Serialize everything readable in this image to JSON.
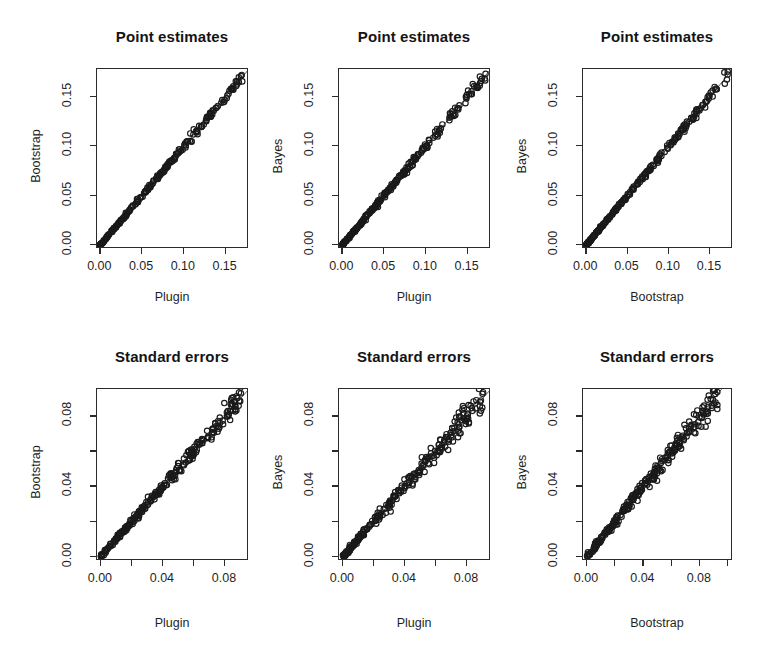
{
  "figure": {
    "width": 774,
    "height": 668,
    "background": "#ffffff",
    "foreground": "#1a1a1a",
    "point_style": "open-circle",
    "layout": "2 rows x 3 columns of scatterplots"
  },
  "chart_data": [
    {
      "id": "panel-1",
      "type": "scatter",
      "title": "Point estimates",
      "xlabel": "Plugin",
      "ylabel": "Bootstrap",
      "xlim": [
        -0.004,
        0.178
      ],
      "ylim": [
        -0.004,
        0.178
      ],
      "xticks": [
        0.0,
        0.05,
        0.1,
        0.15
      ],
      "yticks": [
        0.0,
        0.05,
        0.1,
        0.15
      ],
      "xticklabels": [
        "0.00",
        "0.05",
        "0.10",
        "0.15"
      ],
      "yticklabels": [
        "0.00",
        "0.05",
        "0.10",
        "0.15"
      ],
      "grid": false,
      "legend": "none",
      "reference_line": "y = x",
      "seed": 11,
      "n": 260,
      "noise": 0.0022,
      "xmax_data": 0.172,
      "density_exponent": 1.55
    },
    {
      "id": "panel-2",
      "type": "scatter",
      "title": "Point estimates",
      "xlabel": "Plugin",
      "ylabel": "Bayes",
      "xlim": [
        -0.004,
        0.178
      ],
      "ylim": [
        -0.004,
        0.178
      ],
      "xticks": [
        0.0,
        0.05,
        0.1,
        0.15
      ],
      "yticks": [
        0.0,
        0.05,
        0.1,
        0.15
      ],
      "xticklabels": [
        "0.00",
        "0.05",
        "0.10",
        "0.15"
      ],
      "yticklabels": [
        "0.00",
        "0.05",
        "0.10",
        "0.15"
      ],
      "grid": false,
      "legend": "none",
      "reference_line": "y = x",
      "seed": 27,
      "n": 260,
      "noise": 0.0026,
      "xmax_data": 0.172,
      "density_exponent": 1.55
    },
    {
      "id": "panel-3",
      "type": "scatter",
      "title": "Point estimates",
      "xlabel": "Bootstrap",
      "ylabel": "Bayes",
      "xlim": [
        -0.004,
        0.178
      ],
      "ylim": [
        -0.004,
        0.178
      ],
      "xticks": [
        0.0,
        0.05,
        0.1,
        0.15
      ],
      "yticks": [
        0.0,
        0.05,
        0.1,
        0.15
      ],
      "xticklabels": [
        "0.00",
        "0.05",
        "0.10",
        "0.15"
      ],
      "yticklabels": [
        "0.00",
        "0.05",
        "0.10",
        "0.15"
      ],
      "grid": false,
      "legend": "none",
      "reference_line": "y = x",
      "seed": 43,
      "n": 260,
      "noise": 0.0024,
      "xmax_data": 0.172,
      "density_exponent": 1.55
    },
    {
      "id": "panel-4",
      "type": "scatter",
      "title": "Standard errors",
      "xlabel": "Plugin",
      "ylabel": "Bootstrap",
      "xlim": [
        -0.0025,
        0.0955
      ],
      "ylim": [
        -0.0025,
        0.0955
      ],
      "xticks": [
        0.0,
        0.02,
        0.04,
        0.06,
        0.08
      ],
      "yticks": [
        0.0,
        0.02,
        0.04,
        0.06,
        0.08
      ],
      "xticklabels": [
        "0.00",
        "",
        "0.04",
        "",
        "0.08"
      ],
      "yticklabels": [
        "0.00",
        "",
        "0.04",
        "",
        "0.08"
      ],
      "grid": false,
      "legend": "none",
      "reference_line": "y = x",
      "seed": 61,
      "n": 260,
      "noise": 0.0028,
      "xmax_data": 0.0905,
      "density_exponent": 1.2
    },
    {
      "id": "panel-5",
      "type": "scatter",
      "title": "Standard errors",
      "xlabel": "Plugin",
      "ylabel": "Bayes",
      "xlim": [
        -0.0025,
        0.0955
      ],
      "ylim": [
        -0.0025,
        0.0955
      ],
      "xticks": [
        0.0,
        0.02,
        0.04,
        0.06,
        0.08
      ],
      "yticks": [
        0.0,
        0.02,
        0.04,
        0.06,
        0.08
      ],
      "xticklabels": [
        "0.00",
        "",
        "0.04",
        "",
        "0.08"
      ],
      "yticklabels": [
        "0.00",
        "",
        "0.04",
        "",
        "0.08"
      ],
      "grid": false,
      "legend": "none",
      "reference_line": "y = x",
      "seed": 79,
      "n": 260,
      "noise": 0.0032,
      "xmax_data": 0.0905,
      "density_exponent": 1.2
    },
    {
      "id": "panel-6",
      "type": "scatter",
      "title": "Standard errors",
      "xlabel": "Bootstrap",
      "ylabel": "Bayes",
      "xlim": [
        -0.0028,
        0.1035
      ],
      "ylim": [
        -0.0025,
        0.0955
      ],
      "xticks": [
        0.0,
        0.02,
        0.04,
        0.06,
        0.08,
        0.1
      ],
      "yticks": [
        0.0,
        0.02,
        0.04,
        0.06,
        0.08
      ],
      "xticklabels": [
        "0.00",
        "",
        "0.04",
        "",
        "0.08",
        ""
      ],
      "yticklabels": [
        "0.00",
        "",
        "0.04",
        "",
        "0.08"
      ],
      "grid": false,
      "legend": "none",
      "reference_line": "y = x",
      "seed": 97,
      "n": 260,
      "noise": 0.0036,
      "xmax_data": 0.0935,
      "density_exponent": 1.2
    }
  ],
  "panel_geometry": [
    {
      "box": [
        96,
        68,
        152,
        180
      ],
      "title_y": 28,
      "xtitle_y": 290,
      "ytitle_x": 36
    },
    {
      "box": [
        338,
        68,
        152,
        180
      ],
      "title_y": 28,
      "xtitle_y": 290,
      "ytitle_x": 278
    },
    {
      "box": [
        582,
        68,
        150,
        180
      ],
      "title_y": 28,
      "xtitle_y": 290,
      "ytitle_x": 522
    },
    {
      "box": [
        96,
        388,
        152,
        172
      ],
      "title_y": 348,
      "xtitle_y": 616,
      "ytitle_x": 36
    },
    {
      "box": [
        338,
        388,
        152,
        172
      ],
      "title_y": 348,
      "xtitle_y": 616,
      "ytitle_x": 278
    },
    {
      "box": [
        582,
        388,
        150,
        172
      ],
      "title_y": 348,
      "xtitle_y": 616,
      "ytitle_x": 522
    }
  ]
}
